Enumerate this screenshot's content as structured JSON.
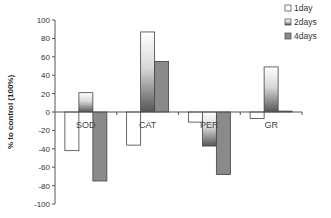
{
  "chart_data": {
    "type": "bar",
    "title": "",
    "xlabel": "",
    "ylabel": "% to control (100%)",
    "ylim": [
      -100,
      100
    ],
    "yticks": [
      100,
      80,
      60,
      40,
      20,
      0,
      -20,
      -40,
      -60,
      -80,
      -100
    ],
    "grid": false,
    "legend_position": "top-right",
    "categories": [
      "SOD",
      "CAT",
      "PER",
      "GR"
    ],
    "series": [
      {
        "name": "1day",
        "fill": "#ffffff",
        "values": [
          -42,
          -36,
          -11,
          -7
        ]
      },
      {
        "name": "2days",
        "fill": "gradient",
        "values": [
          21,
          87,
          -37,
          49
        ]
      },
      {
        "name": "4days",
        "fill": "#8a8a8a",
        "values": [
          -75,
          55,
          -68,
          1
        ]
      }
    ]
  },
  "colors": {
    "axis": "#555555",
    "bar_outline": "#444444",
    "series_4days": "#8a8a8a",
    "gradient_light": "#ffffff",
    "gradient_dark": "#555555"
  }
}
